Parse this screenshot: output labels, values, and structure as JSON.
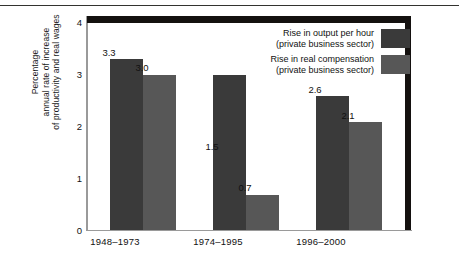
{
  "chart_data": {
    "type": "bar",
    "title": "",
    "xlabel": "",
    "ylabel": "Percentage annual rate of increase of productivity and real wages",
    "ylim": [
      0,
      4
    ],
    "yticks": [
      "0",
      "1",
      "2",
      "3",
      "4"
    ],
    "grid": false,
    "legend_position": "top-right",
    "categories": [
      "1948–1973",
      "1974–1995",
      "1996–2000"
    ],
    "series": [
      {
        "name": "Rise in output per hour (private business sector)",
        "name_line1": "Rise in output per hour",
        "name_line2": "(private business sector)",
        "color": "#3a3a3a",
        "values": [
          3.3,
          3.0,
          2.6
        ],
        "labels": [
          "3.3",
          "1.5",
          "2.6"
        ]
      },
      {
        "name": "Rise in real compensation (private business sector)",
        "name_line1": "Rise in real compensation",
        "name_line2": "(private business sector)",
        "color": "#575757",
        "values": [
          3.0,
          0.7,
          2.1
        ],
        "labels": [
          "3.0",
          "0.7",
          "2.1"
        ]
      }
    ]
  },
  "axis": {
    "y_title_line1": "Percentage",
    "y_title_line2": "annual rate of increase",
    "y_title_line3": "of productivity and real wages"
  },
  "values": {
    "g1s1": "3.3",
    "g1s2": "3.0",
    "g2s1": "1.5",
    "g2s2": "0.7",
    "g3s1": "2.6",
    "g3s2": "2.1"
  },
  "ytick": {
    "t0": "0",
    "t1": "1",
    "t2": "2",
    "t3": "3",
    "t4": "4"
  }
}
